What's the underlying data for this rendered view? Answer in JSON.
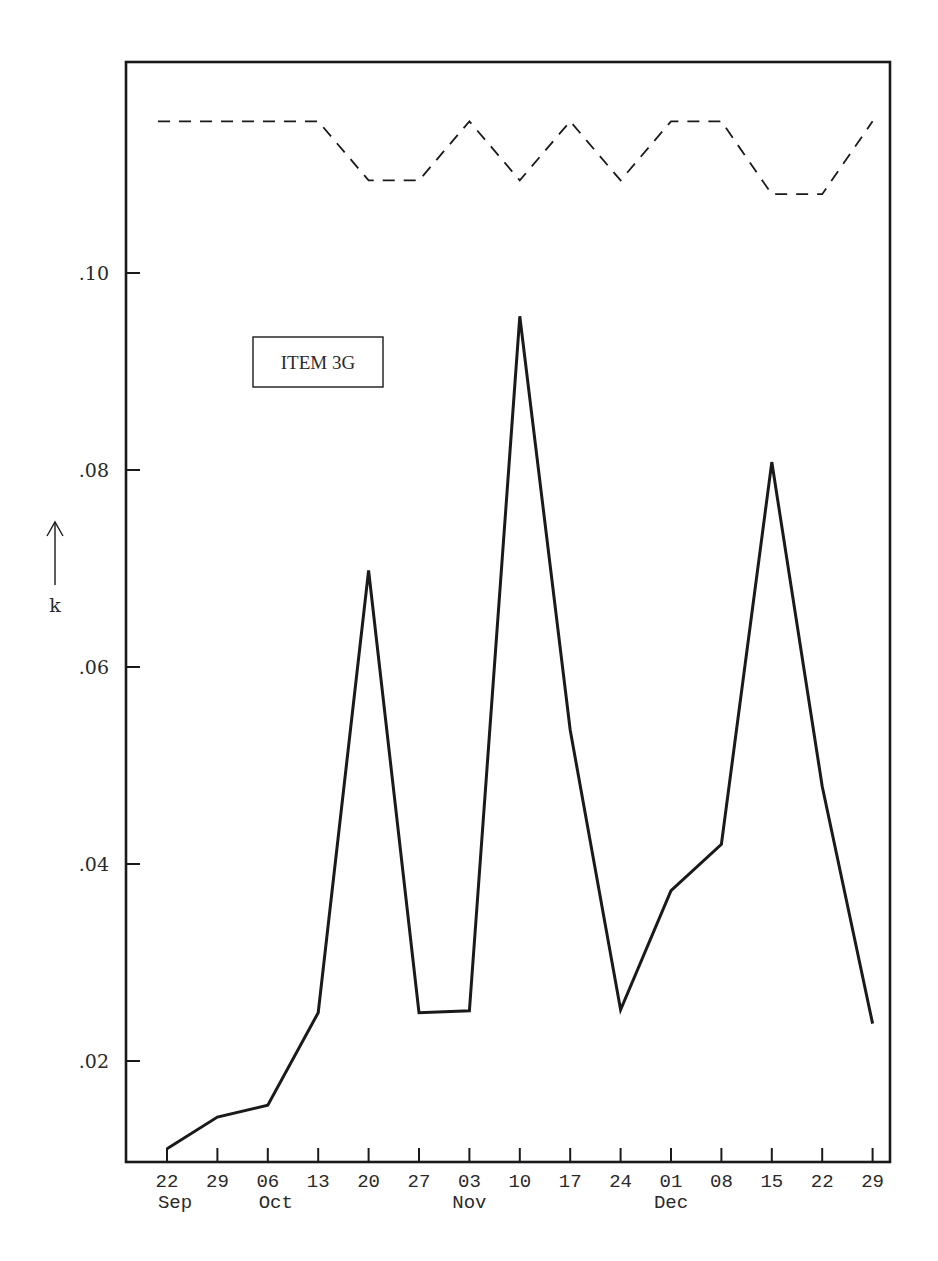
{
  "chart_data": {
    "type": "line",
    "title": "",
    "annotation": "ITEM  3G",
    "xlabel": "",
    "ylabel": "k",
    "ylabel_arrow": "up",
    "ylim": [
      0.0098,
      0.1216
    ],
    "yticks": [
      ".02",
      ".04",
      ".06",
      ".08",
      ".10"
    ],
    "ytick_values": [
      0.02,
      0.04,
      0.06,
      0.08,
      0.1
    ],
    "grid": false,
    "legend": null,
    "categories": [
      "22",
      "29",
      "06",
      "13",
      "20",
      "27",
      "03",
      "10",
      "17",
      "24",
      "01",
      "08",
      "15",
      "22",
      "29"
    ],
    "month_labels": [
      {
        "label": "Sep",
        "at_index": 0
      },
      {
        "label": "Oct",
        "at_index": 2
      },
      {
        "label": "Nov",
        "at_index": 6
      },
      {
        "label": "Dec",
        "at_index": 10
      }
    ],
    "series": [
      {
        "name": "k (solid)",
        "style": "solid",
        "values": [
          0.0111,
          0.0143,
          0.0155,
          0.0249,
          0.0698,
          0.0249,
          0.0251,
          0.0956,
          0.0536,
          0.0252,
          0.0373,
          0.042,
          0.0808,
          0.0479,
          0.0238
        ]
      },
      {
        "name": "upper limit (dashed)",
        "style": "dashed",
        "values": [
          0.1154,
          0.1154,
          0.1154,
          0.1154,
          0.1094,
          0.1094,
          0.1154,
          0.1094,
          0.1154,
          0.1094,
          0.1154,
          0.1154,
          0.108,
          0.108,
          0.1154
        ]
      }
    ]
  },
  "colors": {
    "ink": "#1a1a1a",
    "background": "#ffffff"
  }
}
